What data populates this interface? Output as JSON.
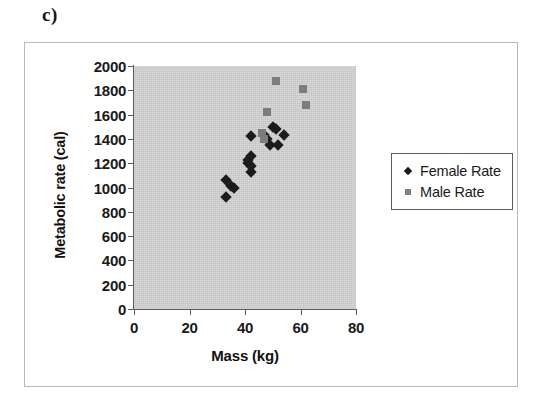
{
  "panel": {
    "label": "c)"
  },
  "chart_data": {
    "type": "scatter",
    "title": "",
    "xlabel": "Mass (kg)",
    "ylabel": "Metabolic rate (cal)",
    "xlim": [
      0,
      80
    ],
    "ylim": [
      0,
      2000
    ],
    "xticks": [
      0,
      20,
      40,
      60,
      80
    ],
    "yticks": [
      0,
      200,
      400,
      600,
      800,
      1000,
      1200,
      1400,
      1600,
      1800,
      2000
    ],
    "grid": false,
    "plot_background": "#c4c4c4",
    "legend_position": "right",
    "series": [
      {
        "name": "Female Rate",
        "marker": "diamond",
        "color": "#1c1c1c",
        "points": [
          [
            33,
            920
          ],
          [
            33,
            1060
          ],
          [
            35,
            1010
          ],
          [
            36,
            1000
          ],
          [
            41,
            1200
          ],
          [
            41,
            1230
          ],
          [
            42,
            1180
          ],
          [
            42,
            1260
          ],
          [
            42,
            1130
          ],
          [
            42,
            1420
          ],
          [
            47,
            1430
          ],
          [
            48,
            1400
          ],
          [
            49,
            1350
          ],
          [
            50,
            1500
          ],
          [
            51,
            1480
          ],
          [
            52,
            1350
          ],
          [
            54,
            1430
          ]
        ]
      },
      {
        "name": "Male Rate",
        "marker": "square",
        "color": "#7d7d7d",
        "points": [
          [
            46,
            1450
          ],
          [
            47,
            1400
          ],
          [
            48,
            1620
          ],
          [
            51,
            1880
          ],
          [
            61,
            1810
          ],
          [
            62,
            1680
          ]
        ]
      }
    ]
  },
  "legend": {
    "entries": [
      {
        "label": "Female Rate",
        "icon": "diamond-marker-icon"
      },
      {
        "label": "Male Rate",
        "icon": "square-marker-icon"
      }
    ]
  }
}
